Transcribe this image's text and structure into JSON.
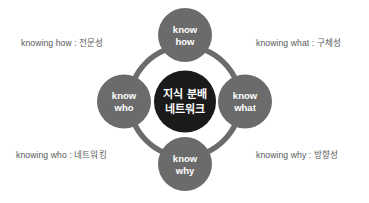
{
  "diagram": {
    "type": "hub-and-spoke-circular",
    "title_center": {
      "line1": "지식 분배",
      "line2": "네트워크"
    },
    "colors": {
      "node_fill": "#6b6b6b",
      "ring_stroke": "#6b6b6b",
      "center_fill": "#1a1a1a",
      "node_text": "#ffffff",
      "caption_text": "#58585a",
      "background": "#ffffff"
    },
    "nodes": [
      {
        "id": "know-how",
        "position": "top",
        "line1": "know",
        "line2": "how"
      },
      {
        "id": "know-what",
        "position": "right",
        "line1": "know",
        "line2": "what"
      },
      {
        "id": "know-why",
        "position": "bottom",
        "line1": "know",
        "line2": "why"
      },
      {
        "id": "know-who",
        "position": "left",
        "line1": "know",
        "line2": "who"
      }
    ],
    "captions": [
      {
        "id": "knowing-how",
        "corner": "top-left",
        "text": "knowing how : 전문성"
      },
      {
        "id": "knowing-what",
        "corner": "top-right",
        "text": "knowing what : 구체성"
      },
      {
        "id": "knowing-who",
        "corner": "bottom-left",
        "text": "knowing who : 네트워킹"
      },
      {
        "id": "knowing-why",
        "corner": "bottom-right",
        "text": "knowing why : 방향성"
      }
    ]
  }
}
